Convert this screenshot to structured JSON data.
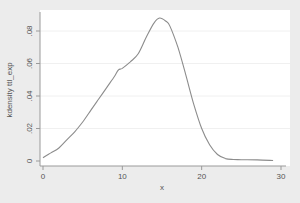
{
  "chart_data": {
    "type": "line",
    "title": "",
    "xlabel": "x",
    "ylabel": "kdensity ttl_exp",
    "xlim": [
      0,
      30
    ],
    "ylim": [
      0,
      0.08
    ],
    "xticks": [
      0,
      10,
      20,
      30
    ],
    "xtick_labels": [
      "0",
      "10",
      "20",
      "30"
    ],
    "yticks": [
      0,
      0.02,
      0.04,
      0.06,
      0.08
    ],
    "ytick_labels": [
      "0",
      ".02",
      ".04",
      ".06",
      ".08"
    ],
    "grid": true,
    "legend": null,
    "series": [
      {
        "name": "kdensity ttl_exp",
        "color": "#8c8c8c",
        "x": [
          0,
          1,
          2,
          3,
          4,
          5,
          6,
          7,
          8,
          9,
          9.5,
          10,
          11,
          12,
          13,
          14,
          14.7,
          15.5,
          16,
          17,
          18,
          19,
          20,
          21,
          22,
          23,
          24,
          25,
          27,
          29
        ],
        "y": [
          0.002,
          0.005,
          0.008,
          0.013,
          0.018,
          0.024,
          0.031,
          0.038,
          0.045,
          0.052,
          0.056,
          0.057,
          0.061,
          0.066,
          0.076,
          0.085,
          0.088,
          0.086,
          0.083,
          0.07,
          0.053,
          0.035,
          0.02,
          0.01,
          0.004,
          0.0015,
          0.0009,
          0.0008,
          0.0007,
          0.0003
        ]
      }
    ]
  },
  "labels": {
    "xlabel": "x",
    "ylabel": "kdensity ttl_exp"
  }
}
